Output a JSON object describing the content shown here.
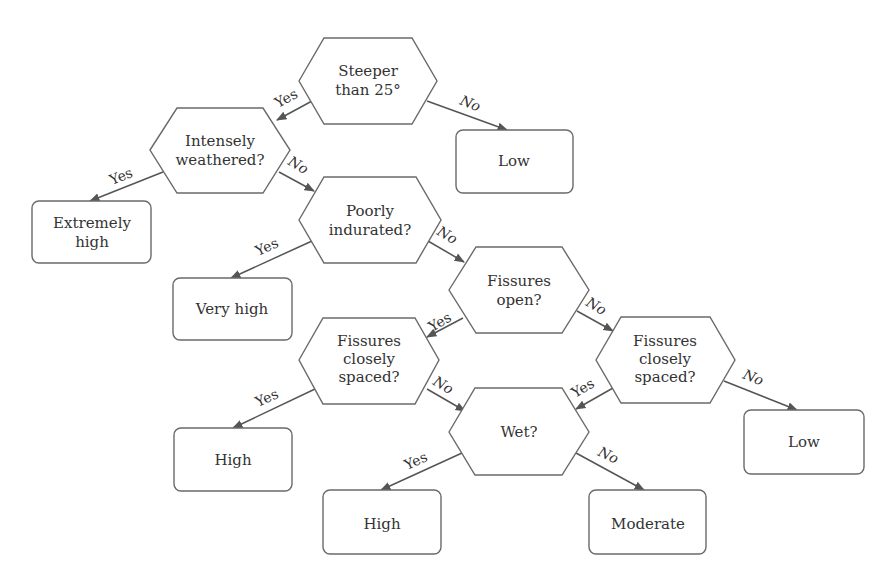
{
  "diagram": {
    "type": "decision-tree",
    "nodes": {
      "steeper": {
        "kind": "decision",
        "lines": [
          "Steeper",
          "than 25°"
        ]
      },
      "low_top": {
        "kind": "outcome",
        "lines": [
          "Low"
        ]
      },
      "weathered": {
        "kind": "decision",
        "lines": [
          "Intensely",
          "weathered?"
        ]
      },
      "extremely_high": {
        "kind": "outcome",
        "lines": [
          "Extremely",
          "high"
        ]
      },
      "indurated": {
        "kind": "decision",
        "lines": [
          "Poorly",
          "indurated?"
        ]
      },
      "very_high": {
        "kind": "outcome",
        "lines": [
          "Very high"
        ]
      },
      "fissures_open": {
        "kind": "decision",
        "lines": [
          "Fissures",
          "open?"
        ]
      },
      "spaced_left": {
        "kind": "decision",
        "lines": [
          "Fissures",
          "closely",
          "spaced?"
        ]
      },
      "spaced_right": {
        "kind": "decision",
        "lines": [
          "Fissures",
          "closely",
          "spaced?"
        ]
      },
      "high_left": {
        "kind": "outcome",
        "lines": [
          "High"
        ]
      },
      "wet": {
        "kind": "decision",
        "lines": [
          "Wet?"
        ]
      },
      "low_right": {
        "kind": "outcome",
        "lines": [
          "Low"
        ]
      },
      "high_bottom": {
        "kind": "outcome",
        "lines": [
          "High"
        ]
      },
      "moderate": {
        "kind": "outcome",
        "lines": [
          "Moderate"
        ]
      }
    },
    "edges": [
      {
        "from": "steeper",
        "to": "weathered",
        "label": "Yes"
      },
      {
        "from": "steeper",
        "to": "low_top",
        "label": "No"
      },
      {
        "from": "weathered",
        "to": "extremely_high",
        "label": "Yes"
      },
      {
        "from": "weathered",
        "to": "indurated",
        "label": "No"
      },
      {
        "from": "indurated",
        "to": "very_high",
        "label": "Yes"
      },
      {
        "from": "indurated",
        "to": "fissures_open",
        "label": "No"
      },
      {
        "from": "fissures_open",
        "to": "spaced_left",
        "label": "Yes"
      },
      {
        "from": "fissures_open",
        "to": "spaced_right",
        "label": "No"
      },
      {
        "from": "spaced_left",
        "to": "high_left",
        "label": "Yes"
      },
      {
        "from": "spaced_left",
        "to": "wet",
        "label": "No"
      },
      {
        "from": "spaced_right",
        "to": "wet",
        "label": "Yes"
      },
      {
        "from": "spaced_right",
        "to": "low_right",
        "label": "No"
      },
      {
        "from": "wet",
        "to": "high_bottom",
        "label": "Yes"
      },
      {
        "from": "wet",
        "to": "moderate",
        "label": "No"
      }
    ],
    "labels": {
      "yes": "Yes",
      "no": "No"
    }
  }
}
